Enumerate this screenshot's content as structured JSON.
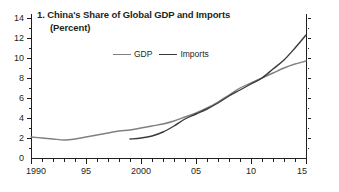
{
  "chart_data": {
    "type": "line",
    "title": "1. China's Share of Global GDP and Imports",
    "subtitle": "(Percent)",
    "xlabel": "",
    "ylabel": "",
    "xlim": [
      1990,
      2015
    ],
    "ylim": [
      0,
      14
    ],
    "ytick_values": [
      0,
      2,
      4,
      6,
      8,
      10,
      12,
      14
    ],
    "ytick_labels": [
      "0",
      "2",
      "4",
      "6",
      "8",
      "10",
      "12",
      "14"
    ],
    "yminor_step": 1,
    "xtick_values": [
      1990,
      1995,
      2000,
      2005,
      2010,
      2015
    ],
    "xtick_labels": [
      "1990",
      "95",
      "2000",
      "05",
      "10",
      "15"
    ],
    "xminor_step": 1,
    "grid": false,
    "legend_position": "top-center",
    "series": [
      {
        "name": "GDP",
        "color": "#807f83",
        "x": [
          1990,
          1991,
          1992,
          1993,
          1994,
          1995,
          1996,
          1997,
          1998,
          1999,
          2000,
          2001,
          2002,
          2003,
          2004,
          2005,
          2006,
          2007,
          2008,
          2009,
          2010,
          2011,
          2012,
          2013,
          2014,
          2015
        ],
        "values": [
          2.1,
          2.0,
          1.9,
          1.8,
          1.9,
          2.1,
          2.3,
          2.5,
          2.7,
          2.8,
          3.0,
          3.2,
          3.4,
          3.7,
          4.1,
          4.5,
          5.0,
          5.6,
          6.3,
          7.0,
          7.5,
          8.0,
          8.5,
          9.0,
          9.4,
          9.7
        ],
        "style": "solid",
        "width": 1.4
      },
      {
        "name": "Imports",
        "color": "#3b3a3e",
        "x": [
          1999,
          2000,
          2001,
          2002,
          2003,
          2004,
          2005,
          2006,
          2007,
          2008,
          2009,
          2010,
          2011,
          2012,
          2013,
          2014,
          2015
        ],
        "values": [
          1.9,
          2.0,
          2.2,
          2.6,
          3.2,
          3.9,
          4.4,
          4.9,
          5.5,
          6.2,
          6.8,
          7.4,
          8.0,
          8.9,
          9.8,
          11.0,
          12.3
        ],
        "style": "solid",
        "width": 1.4
      }
    ],
    "legend": [
      {
        "label": "GDP",
        "color": "#807f83"
      },
      {
        "label": "Imports",
        "color": "#3b3a3e"
      }
    ],
    "axis_color": "#231f20"
  }
}
